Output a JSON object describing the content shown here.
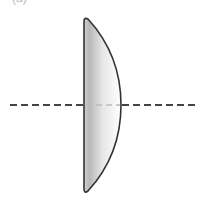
{
  "figure": {
    "label": "(a)",
    "type": "plano-convex lens",
    "colors": {
      "outline": "#333333",
      "fill_dark": "#c8c8c8",
      "fill_light": "#ffffff",
      "axis_outside": "#444444",
      "axis_inside": "#bbbbbb"
    }
  }
}
